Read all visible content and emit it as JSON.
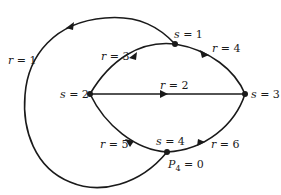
{
  "diagram": {
    "type": "directed-graph",
    "nodes": [
      {
        "id": "s1",
        "label_var": "s",
        "label_eq": " = 1"
      },
      {
        "id": "s2",
        "label_var": "s",
        "label_eq": " = 2"
      },
      {
        "id": "s3",
        "label_var": "s",
        "label_eq": " = 3"
      },
      {
        "id": "s4",
        "label_var": "s",
        "label_eq": " = 4"
      }
    ],
    "edges": [
      {
        "id": "r1",
        "from": "s1",
        "to": "s4",
        "label_var": "r",
        "label_eq": " = 1"
      },
      {
        "id": "r2",
        "from": "s2",
        "to": "s3",
        "label_var": "r",
        "label_eq": " = 2"
      },
      {
        "id": "r3",
        "from": "s1",
        "to": "s2",
        "label_var": "r",
        "label_eq": " = 3"
      },
      {
        "id": "r4",
        "from": "s1",
        "to": "s3",
        "label_var": "r",
        "label_eq": " = 4"
      },
      {
        "id": "r5",
        "from": "s4",
        "to": "s2",
        "label_var": "r",
        "label_eq": " = 5"
      },
      {
        "id": "r6",
        "from": "s4",
        "to": "s3",
        "label_var": "r",
        "label_eq": " = 6"
      }
    ],
    "annotation": {
      "var": "P",
      "sub": "4",
      "eq": " = 0"
    }
  }
}
